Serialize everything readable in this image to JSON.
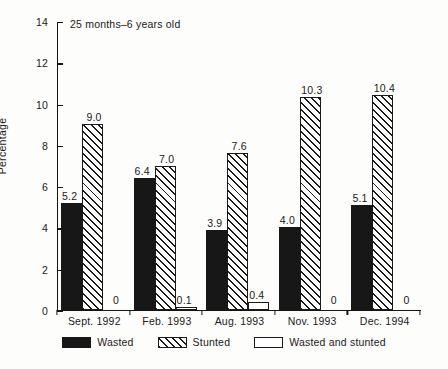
{
  "chart_data": {
    "type": "bar",
    "title": "",
    "annotation": "25 months–6 years old",
    "xlabel": "",
    "ylabel": "Percentage",
    "ylim": [
      0,
      14
    ],
    "yticks": [
      0,
      2,
      4,
      6,
      8,
      10,
      12,
      14
    ],
    "grid": false,
    "legend_position": "bottom",
    "categories": [
      "Sept. 1992",
      "Feb. 1993",
      "Aug. 1993",
      "Nov. 1993",
      "Dec. 1994"
    ],
    "series": [
      {
        "name": "Wasted",
        "pattern": "solid-black",
        "color": "#171717",
        "values": [
          5.2,
          6.4,
          3.9,
          4.0,
          5.1
        ],
        "labels": [
          "5.2",
          "6.4",
          "3.9",
          "4.0",
          "5.1"
        ]
      },
      {
        "name": "Stunted",
        "pattern": "diagonal-hatch",
        "color": "#1a1a1a",
        "values": [
          9.0,
          7.0,
          7.6,
          10.3,
          10.4
        ],
        "labels": [
          "9.0",
          "7.0",
          "7.6",
          "10.3",
          "10.4"
        ]
      },
      {
        "name": "Wasted and stunted",
        "pattern": "white-outline",
        "color": "#ffffff",
        "values": [
          0,
          0.1,
          0.4,
          0,
          0
        ],
        "labels": [
          "0",
          "0.1",
          "0.4",
          "0",
          "0"
        ]
      }
    ]
  },
  "legend": {
    "items": [
      {
        "label": "Wasted",
        "swatch": "solid-black"
      },
      {
        "label": "Stunted",
        "swatch": "diagonal-hatch"
      },
      {
        "label": "Wasted and stunted",
        "swatch": "white-outline"
      }
    ]
  }
}
